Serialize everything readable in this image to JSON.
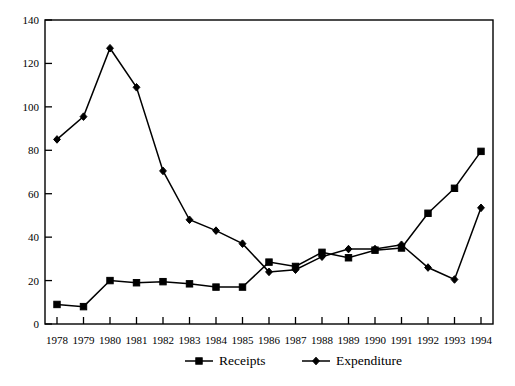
{
  "chart_data": {
    "type": "line",
    "title": "",
    "subtitle": "",
    "xlabel": "",
    "ylabel": "",
    "categories": [
      "1978",
      "1979",
      "1980",
      "1981",
      "1982",
      "1983",
      "1984",
      "1985",
      "1986",
      "1987",
      "1988",
      "1989",
      "1990",
      "1991",
      "1992",
      "1993",
      "1994"
    ],
    "ylim": [
      0,
      140
    ],
    "yticks": [
      "0",
      "20",
      "40",
      "60",
      "80",
      "100",
      "120",
      "140"
    ],
    "ytick_values": [
      0,
      20,
      40,
      60,
      80,
      100,
      120,
      140
    ],
    "grid": false,
    "legend_position": "bottom",
    "series": [
      {
        "name": "Receipts",
        "marker": "square",
        "color": "#000000",
        "values": [
          9,
          8,
          20,
          19,
          19.5,
          18.5,
          17,
          17,
          28.5,
          26.5,
          33,
          30.5,
          34,
          35,
          51,
          62.5,
          79.5
        ]
      },
      {
        "name": "Expenditure",
        "marker": "diamond",
        "color": "#000000",
        "values": [
          85,
          95.5,
          127,
          109,
          70.5,
          48,
          43,
          37,
          24,
          25,
          31,
          34.5,
          34.5,
          36.5,
          26,
          20.5,
          53.5
        ]
      }
    ]
  },
  "legend": {
    "items": [
      {
        "label": "Receipts",
        "marker": "square"
      },
      {
        "label": "Expenditure",
        "marker": "diamond"
      }
    ]
  }
}
